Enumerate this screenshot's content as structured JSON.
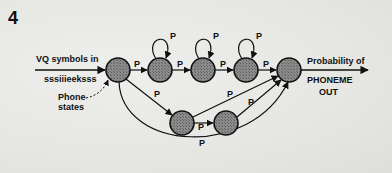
{
  "figure": {
    "number": "4",
    "input_label_line1": "VQ symbols in",
    "input_label_line2": "sssiiieeksss",
    "annotation_line1": "Phone",
    "annotation_line2": "states",
    "output_label_line1": "Probability of",
    "output_label_line2": "PHONEME",
    "output_label_line3": "OUT",
    "transition_label": "P"
  },
  "nodes": [
    {
      "id": "s0",
      "cx": 118,
      "cy": 70
    },
    {
      "id": "s1",
      "cx": 160,
      "cy": 70
    },
    {
      "id": "s2",
      "cx": 203,
      "cy": 70
    },
    {
      "id": "s3",
      "cx": 246,
      "cy": 70
    },
    {
      "id": "s4",
      "cx": 289,
      "cy": 70
    },
    {
      "id": "l1",
      "cx": 182,
      "cy": 123
    },
    {
      "id": "l2",
      "cx": 226,
      "cy": 123
    }
  ],
  "edges": [
    {
      "from": "s0",
      "to": "s1",
      "label": "P"
    },
    {
      "from": "s1",
      "to": "s2",
      "label": "P"
    },
    {
      "from": "s2",
      "to": "s3",
      "label": "P"
    },
    {
      "from": "s3",
      "to": "s4",
      "label": "P"
    },
    {
      "from": "s1",
      "to": "s1",
      "label": "P"
    },
    {
      "from": "s2",
      "to": "s2",
      "label": "P"
    },
    {
      "from": "s3",
      "to": "s3",
      "label": "P"
    },
    {
      "from": "s0",
      "to": "l1",
      "label": "P"
    },
    {
      "from": "l1",
      "to": "l2",
      "label": "P"
    },
    {
      "from": "l1",
      "to": "s4",
      "label": "P"
    },
    {
      "from": "l2",
      "to": "s4",
      "label": "P"
    },
    {
      "from": "s0",
      "to": "s4",
      "label": "P"
    }
  ]
}
